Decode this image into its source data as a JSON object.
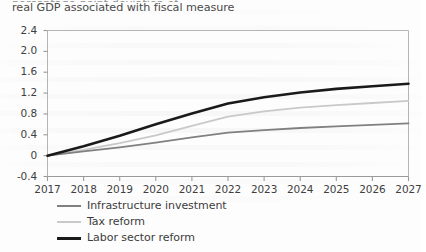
{
  "caption": {
    "cut_line_above": "percentage-point deviation of",
    "text": "real GDP associated with fiscal measure"
  },
  "chart_data": {
    "type": "line",
    "title": "",
    "xlabel": "",
    "ylabel": "",
    "x": [
      2017,
      2018,
      2019,
      2020,
      2021,
      2022,
      2023,
      2024,
      2025,
      2026,
      2027
    ],
    "categories": [
      "2017",
      "2018",
      "2019",
      "2020",
      "2021",
      "2022",
      "2023",
      "2024",
      "2025",
      "2026",
      "2027"
    ],
    "series": [
      {
        "name": "Infrastructure investment",
        "color": "#808080",
        "width": 1.8,
        "values": [
          0.0,
          0.08,
          0.16,
          0.25,
          0.35,
          0.44,
          0.49,
          0.53,
          0.56,
          0.59,
          0.62
        ]
      },
      {
        "name": "Tax reform",
        "color": "#c9c9c9",
        "width": 1.8,
        "values": [
          0.0,
          0.11,
          0.24,
          0.39,
          0.57,
          0.75,
          0.85,
          0.92,
          0.97,
          1.01,
          1.05
        ]
      },
      {
        "name": "Labor sector reform",
        "color": "#1a1a1a",
        "width": 2.6,
        "values": [
          0.0,
          0.18,
          0.38,
          0.6,
          0.81,
          1.0,
          1.12,
          1.21,
          1.28,
          1.33,
          1.38
        ]
      }
    ],
    "ylim": [
      -0.4,
      2.4
    ],
    "yticks": [
      "2.4",
      "2.0",
      "1.6",
      "1.2",
      "0.8",
      "0.4",
      "0",
      "-0.4"
    ],
    "ytick_values": [
      2.4,
      2.0,
      1.6,
      1.2,
      0.8,
      0.4,
      0.0,
      -0.4
    ],
    "grid": false,
    "legend_position": "below",
    "axis_color": "#9a9a9a"
  },
  "legend": [
    {
      "label": "Infrastructure investment",
      "color": "#808080",
      "thickness": "2px"
    },
    {
      "label": "Tax reform",
      "color": "#c9c9c9",
      "thickness": "2px"
    },
    {
      "label": "Labor sector reform",
      "color": "#1a1a1a",
      "thickness": "3px"
    }
  ]
}
